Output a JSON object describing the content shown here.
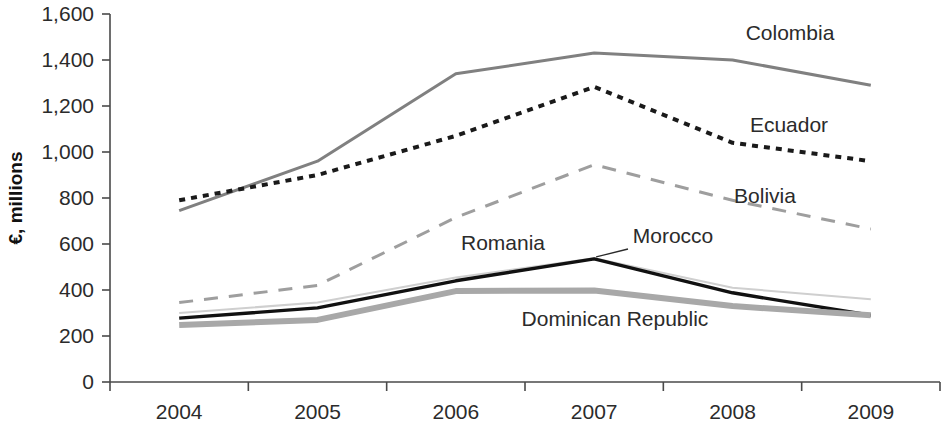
{
  "chart_data": {
    "type": "line",
    "title": "",
    "subtitle": "",
    "xlabel": "",
    "ylabel": "€, millions",
    "categories": [
      "2004",
      "2005",
      "2006",
      "2007",
      "2008",
      "2009"
    ],
    "x_tick_labels": [
      "2004",
      "2005",
      "2006",
      "2007",
      "2008",
      "2009"
    ],
    "y_tick_labels": [
      "0",
      "200",
      "400",
      "600",
      "800",
      "1,000",
      "1,200",
      "1,400",
      "1,600"
    ],
    "y_tick_values": [
      0,
      200,
      400,
      600,
      800,
      1000,
      1200,
      1400,
      1600
    ],
    "ylim": [
      0,
      1600
    ],
    "grid": false,
    "legend": "inline-labels",
    "legend_position": "inline",
    "series": [
      {
        "name": "Colombia",
        "values": [
          745,
          960,
          1340,
          1430,
          1400,
          1290
        ],
        "style": "solid",
        "color": "#808080",
        "width": 3.0,
        "label_x": 790,
        "label_y": 40
      },
      {
        "name": "Ecuador",
        "values": [
          790,
          900,
          1070,
          1283,
          1040,
          960
        ],
        "style": "dotted",
        "color": "#1a1a1a",
        "width": 4.0,
        "label_x": 789,
        "label_y": 132
      },
      {
        "name": "Bolivia",
        "values": [
          345,
          420,
          715,
          945,
          790,
          665
        ],
        "style": "dashed",
        "color": "#9e9e9e",
        "width": 3.0,
        "label_x": 765,
        "label_y": 203
      },
      {
        "name": "Romania",
        "values": [
          300,
          345,
          455,
          538,
          410,
          360
        ],
        "style": "solid",
        "color": "#cfcfcf",
        "width": 2.0,
        "label_x": 503,
        "label_y": 250
      },
      {
        "name": "Morocco",
        "values": [
          278,
          322,
          440,
          535,
          388,
          290
        ],
        "style": "solid",
        "color": "#111111",
        "width": 3.4,
        "label_x": 673,
        "label_y": 243
      },
      {
        "name": "Dominican Republic",
        "values": [
          248,
          270,
          395,
          398,
          330,
          290
        ],
        "style": "solid",
        "color": "#a8a8a8",
        "width": 6.0,
        "label_x": 615,
        "label_y": 326
      }
    ]
  },
  "axes": {
    "y_axis_label": "€, millions",
    "x_axis_label": ""
  }
}
